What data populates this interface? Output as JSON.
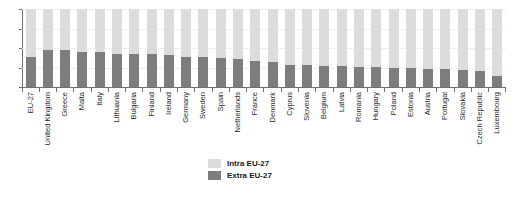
{
  "chart_data": {
    "type": "bar",
    "stacked": true,
    "orientation": "vertical",
    "title": "",
    "xlabel": "",
    "ylabel": "",
    "ylim": [
      0,
      100
    ],
    "yticks": [
      0,
      25,
      50,
      75,
      100
    ],
    "ytick_labels": [
      "0",
      "25",
      "50",
      "75",
      "100"
    ],
    "grid": true,
    "grid_axis": "y",
    "legend_position": "bottom-center",
    "categories": [
      "EU-27",
      "United Kingdom",
      "Greece",
      "Malta",
      "Italy",
      "Lithuania",
      "Bulgaria",
      "Finland",
      "Ireland",
      "Germany",
      "Sweden",
      "Spain",
      "Netherlands",
      "France",
      "Denmark",
      "Cyprus",
      "Slovenia",
      "Belgium",
      "Latvia",
      "Romania",
      "Hungary",
      "Poland",
      "Estonia",
      "Austria",
      "Portugal",
      "Slovakia",
      "Czech Republic",
      "Luxembourg"
    ],
    "series": [
      {
        "name": "Extra EU-27",
        "color": "#7d7d7d",
        "values": [
          38,
          48,
          47,
          45,
          45,
          42,
          42,
          42,
          41,
          39,
          38,
          37,
          36,
          33,
          32,
          28,
          28,
          27,
          27,
          26,
          26,
          25,
          24,
          23,
          23,
          22,
          21,
          14
        ]
      },
      {
        "name": "Intra EU-27",
        "color": "#dcdcdc",
        "values": [
          62,
          52,
          53,
          55,
          55,
          58,
          58,
          58,
          59,
          61,
          62,
          63,
          64,
          67,
          68,
          72,
          72,
          73,
          73,
          74,
          74,
          75,
          76,
          77,
          77,
          78,
          79,
          86
        ]
      }
    ]
  },
  "legend": {
    "items": [
      {
        "label": "Intra EU-27",
        "color": "#dcdcdc"
      },
      {
        "label": "Extra EU-27",
        "color": "#7d7d7d"
      }
    ]
  },
  "title_sliver": ""
}
